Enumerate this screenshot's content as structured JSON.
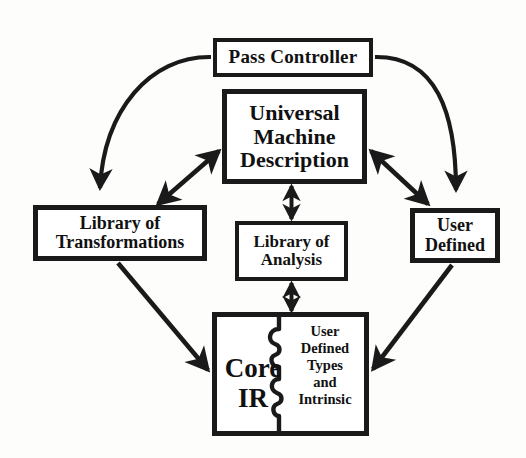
{
  "diagram": {
    "colors": {
      "stroke": "#1a1a1a",
      "background": "#fdfdfc",
      "text": "#111111"
    },
    "nodes": {
      "pass_controller": {
        "label": "Pass Controller"
      },
      "universal_machine_description": {
        "label": "Universal\nMachine\nDescription"
      },
      "library_of_transformations": {
        "label": "Library of\nTransformations"
      },
      "library_of_analysis": {
        "label": "Library of\nAnalysis"
      },
      "user_defined": {
        "label": "User\nDefined"
      },
      "core_ir": {
        "left_label": "Core\nIR",
        "right_label": "User\nDefined\nTypes\nand\nIntrinsic"
      }
    },
    "edges": [
      {
        "id": "pass-controller-to-library-of-transformations",
        "from": "pass_controller",
        "to": "library_of_transformations",
        "style": "curved",
        "heads": "single"
      },
      {
        "id": "pass-controller-to-user-defined",
        "from": "pass_controller",
        "to": "user_defined",
        "style": "curved",
        "heads": "single"
      },
      {
        "id": "umd-to-library-of-transformations",
        "from": "universal_machine_description",
        "to": "library_of_transformations",
        "style": "straight",
        "heads": "double"
      },
      {
        "id": "umd-to-user-defined",
        "from": "universal_machine_description",
        "to": "user_defined",
        "style": "straight",
        "heads": "double"
      },
      {
        "id": "umd-to-library-of-analysis",
        "from": "universal_machine_description",
        "to": "library_of_analysis",
        "style": "straight",
        "heads": "double"
      },
      {
        "id": "library-of-analysis-to-core-ir",
        "from": "library_of_analysis",
        "to": "core_ir",
        "style": "straight",
        "heads": "double"
      },
      {
        "id": "library-of-transformations-to-core-ir",
        "from": "library_of_transformations",
        "to": "core_ir",
        "style": "straight",
        "heads": "single"
      },
      {
        "id": "user-defined-to-core-ir",
        "from": "user_defined",
        "to": "core_ir",
        "style": "straight",
        "heads": "single"
      }
    ]
  }
}
